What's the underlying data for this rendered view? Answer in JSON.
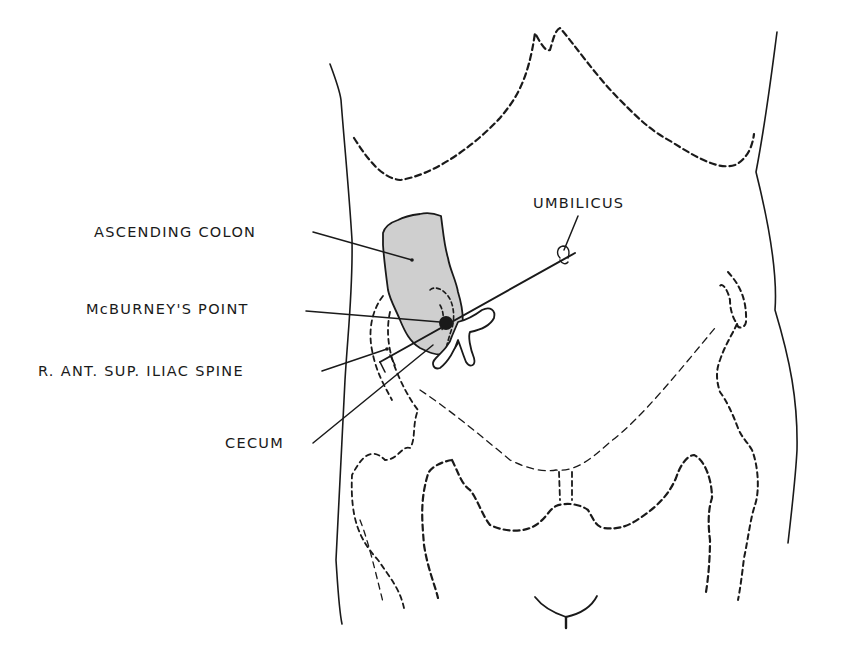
{
  "diagram": {
    "colors": {
      "line": "#1a1a1a",
      "colon_fill": "#cfcfcf",
      "background": "#ffffff"
    },
    "labels": {
      "ascending_colon": "ASCENDING COLON",
      "mcburneys_point": "McBURNEY'S POINT",
      "iliac_spine": "R. ANT. SUP. ILIAC SPINE",
      "cecum": "CECUM",
      "umbilicus": "UMBILICUS"
    },
    "structures": [
      "body-outline-left",
      "body-outline-right",
      "costal-margin",
      "ascending-colon",
      "cecum",
      "appendix",
      "mcburneys-point-marker",
      "spino-umbilical-line",
      "umbilicus",
      "right-iliac-crest",
      "left-iliac-crest",
      "pelvis-outline",
      "pubic-symphysis",
      "femoral-heads",
      "genital-outline"
    ]
  }
}
